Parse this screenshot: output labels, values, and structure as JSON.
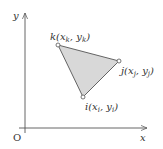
{
  "axes": {
    "y_label": "y",
    "x_label": "x",
    "origin_label": "O",
    "color": "#555555"
  },
  "triangle": {
    "fill": "#d8d8d8",
    "stroke": "#555555",
    "vertices": [
      {
        "name": "k",
        "label": "k(x_k, y_k)",
        "display": "k(xk, yk)",
        "x": 58,
        "y": 45
      },
      {
        "name": "j",
        "label": "j(x_j, y_j)",
        "display": "j(xj, yj)",
        "x": 119,
        "y": 61
      },
      {
        "name": "i",
        "label": "i(x_i, y_i)",
        "display": "i(xi, yi)",
        "x": 83,
        "y": 97
      }
    ]
  }
}
